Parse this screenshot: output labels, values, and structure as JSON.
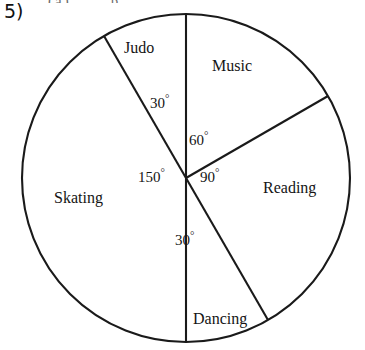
{
  "question": {
    "number": "5)",
    "top_cut_text": "(a) ___ p"
  },
  "chart_data": {
    "type": "pie",
    "title": "",
    "xlabel": "",
    "ylabel": "",
    "units": "degrees",
    "total_degrees": 360,
    "center": {
      "x": 186,
      "y": 178
    },
    "radius": 164,
    "start_angle_deg": 0,
    "direction": "clockwise",
    "grid": false,
    "legend": "none",
    "labels_inside": true,
    "categories": [
      "Music",
      "Reading",
      "Dancing",
      "Skating",
      "Judo"
    ],
    "values": [
      60,
      90,
      30,
      150,
      30
    ],
    "slices": [
      {
        "name": "Music",
        "label": "Music",
        "angle_label": "60",
        "degree_symbol": "°",
        "value": 60,
        "start_deg": 0,
        "end_deg": 60,
        "fill": "#ffffff",
        "stroke": "#1a1a1a"
      },
      {
        "name": "Reading",
        "label": "Reading",
        "angle_label": "90",
        "degree_symbol": "°",
        "value": 90,
        "start_deg": 60,
        "end_deg": 150,
        "fill": "#ffffff",
        "stroke": "#1a1a1a"
      },
      {
        "name": "Dancing",
        "label": "Dancing",
        "angle_label": "30",
        "degree_symbol": "°",
        "value": 30,
        "start_deg": 150,
        "end_deg": 180,
        "fill": "#ffffff",
        "stroke": "#1a1a1a"
      },
      {
        "name": "Skating",
        "label": "Skating",
        "angle_label": "150",
        "degree_symbol": "°",
        "value": 150,
        "start_deg": 180,
        "end_deg": 330,
        "fill": "#ffffff",
        "stroke": "#1a1a1a"
      },
      {
        "name": "Judo",
        "label": "Judo",
        "angle_label": "30",
        "degree_symbol": "°",
        "value": 30,
        "start_deg": 330,
        "end_deg": 360,
        "fill": "#ffffff",
        "stroke": "#1a1a1a"
      }
    ]
  },
  "colors": {
    "ink": "#1a1a1a",
    "page": "#ffffff"
  }
}
